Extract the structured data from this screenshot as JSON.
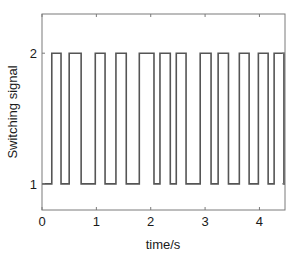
{
  "chart_data": {
    "type": "line",
    "title": "",
    "xlabel": "time/s",
    "ylabel": "Switching signal",
    "xlim": [
      0,
      4.47
    ],
    "ylim": [
      0.8,
      2.3
    ],
    "xticks": [
      0,
      1,
      2,
      3,
      4
    ],
    "yticks": [
      1,
      2
    ],
    "xtick_labels": [
      "0",
      "1",
      "2",
      "3",
      "4"
    ],
    "ytick_labels": [
      "1",
      "2"
    ],
    "grid": false,
    "legend": null,
    "line_color": "#555555",
    "series": [
      {
        "name": "switching signal",
        "step": true,
        "high_intervals": [
          [
            0.18,
            0.35
          ],
          [
            0.5,
            0.72
          ],
          [
            0.98,
            1.16
          ],
          [
            1.36,
            1.55
          ],
          [
            1.79,
            2.06
          ],
          [
            2.17,
            2.36
          ],
          [
            2.47,
            2.65
          ],
          [
            2.91,
            3.11
          ],
          [
            3.24,
            3.43
          ],
          [
            3.63,
            3.81
          ],
          [
            3.98,
            4.16
          ],
          [
            4.27,
            4.45
          ]
        ],
        "low_value": 1,
        "high_value": 2
      }
    ]
  }
}
